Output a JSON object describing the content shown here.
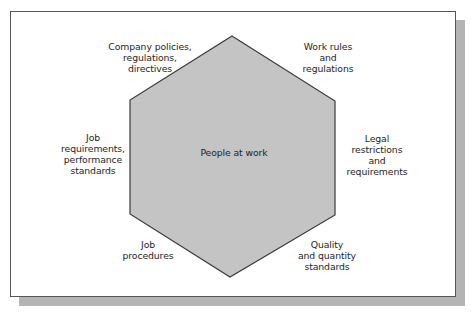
{
  "diagram": {
    "center_label": "People at work",
    "colors": {
      "hexagon_fill": "#c4c4c4",
      "hexagon_stroke": "#3a3a3a",
      "frame_border": "#555555",
      "shadow": "#b4b4b4",
      "text": "#1e1e1e"
    },
    "factors": [
      {
        "position": "top-left",
        "lines": [
          "Company policies,",
          "regulations,",
          "directives"
        ]
      },
      {
        "position": "top-right",
        "lines": [
          "Work rules",
          "and",
          "regulations"
        ]
      },
      {
        "position": "left",
        "lines": [
          "Job",
          "requirements,",
          "performance",
          "standards"
        ]
      },
      {
        "position": "right",
        "lines": [
          "Legal",
          "restrictions",
          "and",
          "requirements"
        ]
      },
      {
        "position": "bottom-left",
        "lines": [
          "Job",
          "procedures"
        ]
      },
      {
        "position": "bottom-right",
        "lines": [
          "Quality",
          "and quantity",
          "standards"
        ]
      }
    ]
  }
}
